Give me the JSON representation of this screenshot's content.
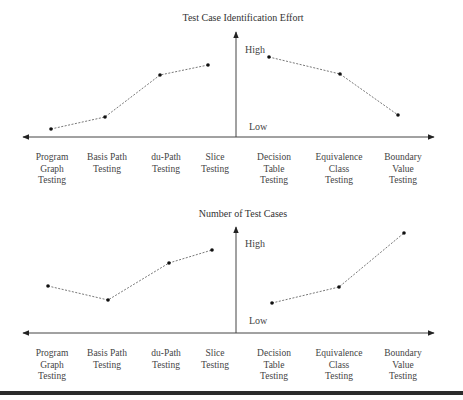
{
  "figure": {
    "bottom_bar_color": "#2b2b2b",
    "line_color": "#555555",
    "axis_color": "#444444"
  },
  "chart_data": [
    {
      "type": "line",
      "title": "Test Case Identification Effort",
      "xlabel": "",
      "ylabel": "Test Case Identification Effort",
      "y_high_label": "High",
      "y_low_label": "Low",
      "grid": false,
      "categories": [
        "Program Graph Testing",
        "Basis Path Testing",
        "du-Path Testing",
        "Slice Testing",
        "Decision Table Testing",
        "Equivalence Class Testing",
        "Boundary Value Testing"
      ],
      "category_lines": [
        [
          "Program",
          "Graph",
          "Testing"
        ],
        [
          "Basis Path",
          "Testing"
        ],
        [
          "du-Path",
          "Testing"
        ],
        [
          "Slice",
          "Testing"
        ],
        [
          "Decision",
          "Table",
          "Testing"
        ],
        [
          "Equivalence",
          "Class",
          "Testing"
        ],
        [
          "Boundary",
          "Value",
          "Testing"
        ]
      ],
      "series": [
        {
          "name": "Code-based (structural)",
          "values": [
            1,
            2.5,
            7.5,
            8.7
          ]
        },
        {
          "name": "Specification-based (functional)",
          "values": [
            9.6,
            7.5,
            2.6
          ]
        }
      ],
      "values_scale": "relative 0 (Low) to 10 (High)",
      "ylim": [
        0,
        10
      ]
    },
    {
      "type": "line",
      "title": "Number of Test Cases",
      "xlabel": "",
      "ylabel": "Number of Test Cases",
      "y_high_label": "High",
      "y_low_label": "Low",
      "grid": false,
      "categories": [
        "Program Graph Testing",
        "Basis Path Testing",
        "du-Path Testing",
        "Slice Testing",
        "Decision Table Testing",
        "Equivalence Class Testing",
        "Boundary Value Testing"
      ],
      "category_lines": [
        [
          "Program",
          "Graph",
          "Testing"
        ],
        [
          "Basis Path",
          "Testing"
        ],
        [
          "du-Path",
          "Testing"
        ],
        [
          "Slice",
          "Testing"
        ],
        [
          "Decision",
          "Table",
          "Testing"
        ],
        [
          "Equivalence",
          "Class",
          "Testing"
        ],
        [
          "Boundary",
          "Value",
          "Testing"
        ]
      ],
      "series": [
        {
          "name": "Code-based (structural)",
          "values": [
            4.6,
            3.3,
            7.0,
            8.3
          ]
        },
        {
          "name": "Specification-based (functional)",
          "values": [
            3.0,
            4.6,
            10.0
          ]
        }
      ],
      "values_scale": "relative 0 (Low) to 10 (High)",
      "ylim": [
        0,
        10
      ]
    }
  ],
  "layout": {
    "panels": [
      {
        "title_x": 243,
        "title_y": 12,
        "axis_y": 137,
        "axis_x0": 21,
        "axis_x1": 436,
        "vaxis_x": 236,
        "vaxis_top": 30,
        "high_label_pos": [
          245,
          44
        ],
        "low_label_pos": [
          249,
          121
        ],
        "label_top": 152,
        "cat_x": [
          52,
          107,
          166,
          215,
          274,
          339,
          403
        ],
        "points_left": [
          [
            51,
            129
          ],
          [
            105,
            117
          ],
          [
            160,
            75
          ],
          [
            208,
            65
          ]
        ],
        "points_right": [
          [
            269,
            57
          ],
          [
            340,
            74
          ],
          [
            398,
            115
          ]
        ]
      },
      {
        "title_x": 243,
        "title_y": 208,
        "axis_y": 333,
        "axis_x0": 21,
        "axis_x1": 436,
        "vaxis_x": 236,
        "vaxis_top": 225,
        "high_label_pos": [
          245,
          238
        ],
        "low_label_pos": [
          249,
          315
        ],
        "label_top": 348,
        "cat_x": [
          52,
          107,
          166,
          215,
          274,
          339,
          403
        ],
        "points_left": [
          [
            48,
            286
          ],
          [
            108,
            300
          ],
          [
            169,
            263
          ],
          [
            212,
            250
          ]
        ],
        "points_right": [
          [
            272,
            303
          ],
          [
            339,
            287
          ],
          [
            404,
            233
          ]
        ]
      }
    ]
  }
}
